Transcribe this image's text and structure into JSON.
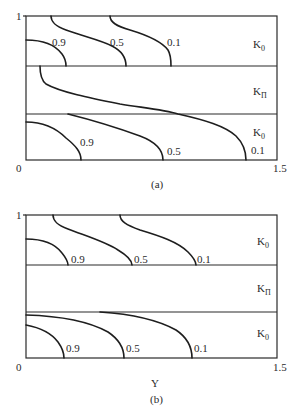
{
  "figure": {
    "panels": [
      {
        "id": "a",
        "caption": "(a)",
        "axis": {
          "x_min": "0",
          "x_max": "1.5",
          "y_top": "1",
          "x_label": ""
        },
        "zones": [
          {
            "label": "K",
            "sub": "0"
          },
          {
            "label": "K",
            "sub": "Π"
          },
          {
            "label": "K",
            "sub": "0"
          }
        ],
        "curve_labels": {
          "top": [
            "0.9",
            "0.5",
            "0.1"
          ],
          "bottom": [
            "0.9",
            "0.5",
            "0.1"
          ]
        }
      },
      {
        "id": "b",
        "caption": "(b)",
        "axis": {
          "x_min": "0",
          "x_max": "1.5",
          "y_top": "1",
          "x_label": "Y"
        },
        "zones": [
          {
            "label": "K",
            "sub": "0"
          },
          {
            "label": "K",
            "sub": "Π"
          },
          {
            "label": "K",
            "sub": "0"
          }
        ],
        "curve_labels": {
          "top": [
            "0.9",
            "0.5",
            "0.1"
          ],
          "bottom": [
            "0.9",
            "0.5",
            "0.1"
          ]
        }
      }
    ]
  }
}
